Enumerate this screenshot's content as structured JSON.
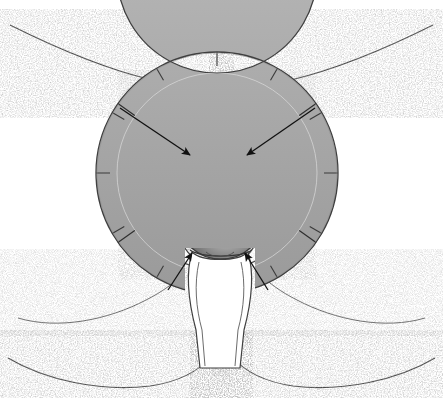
{
  "figure": {
    "domain_note": "grayscale medical line-art illustration",
    "background_color": "#ffffff",
    "width": 443,
    "height": 400
  },
  "palette": {
    "ink": "#3a3a3a",
    "ink_dark": "#1c1c1c",
    "ring_fill": "#a9a9a9",
    "ring_fill_light": "#bdbdbd",
    "ring_edge": "#4a4a4a",
    "mass_dark": "#5a5a5a",
    "mass_mid": "#7d7d7d",
    "mass_light": "#cfcfcf",
    "tissue_light": "#f2f2f2",
    "tissue_mid": "#d4d4d4",
    "os_fill": "#b4b4b4",
    "stipple": "#6e6e6e",
    "arrow": "#111111",
    "white": "#ffffff"
  },
  "retractor_ring": {
    "name": "self-retaining ring retractor",
    "center_x": 217,
    "center_y": 173,
    "outer_radius": 121,
    "inner_radius": 100,
    "band_width": 21,
    "notch_count": 12,
    "notch_angles_deg": [
      -90,
      -60,
      -30,
      0,
      30,
      60,
      90,
      120,
      150,
      180,
      210,
      240
    ],
    "segment_break_angles_deg": [
      -145,
      -35,
      35,
      145
    ],
    "occluded_bottom_arc_deg": [
      72,
      108
    ]
  },
  "inner_oval": {
    "name": "inner tissue margin oval",
    "center_x": 217,
    "center_y": 175,
    "rx": 96,
    "ry": 94
  },
  "arrows": [
    {
      "id": "arrow-upper-left",
      "tail_x": 120,
      "tail_y": 108,
      "tip_x": 190,
      "tip_y": 155,
      "label": "upper left pointer"
    },
    {
      "id": "arrow-upper-right",
      "tail_x": 315,
      "tail_y": 108,
      "tip_x": 247,
      "tip_y": 155,
      "label": "upper right pointer"
    },
    {
      "id": "arrow-lower-left",
      "tail_x": 168,
      "tail_y": 290,
      "tip_x": 192,
      "tip_y": 253,
      "label": "lower left pointer"
    },
    {
      "id": "arrow-lower-right",
      "tail_x": 268,
      "tail_y": 290,
      "tip_x": 245,
      "tip_y": 253,
      "label": "lower right pointer"
    }
  ],
  "anatomy": {
    "dark_mass": {
      "name": "prolapsed spherical mass",
      "center_x": 221,
      "center_y": 222,
      "rx": 41,
      "ry": 37,
      "highlight_x": 228,
      "highlight_y": 228
    },
    "os_ring": {
      "name": "circular os with crossing sutures",
      "center_x": 219,
      "center_y": 168,
      "rx": 26,
      "ry": 24,
      "suture_count": 4
    },
    "catheter": {
      "name": "catheter tube",
      "color": "#efefef",
      "outline": "#4a4a4a"
    },
    "suture_threads": {
      "name": "suture threads",
      "count": 5
    },
    "vaginal_vault": {
      "name": "hatched tissue vault",
      "hatch_color": "#555555"
    },
    "exit_tube": {
      "name": "lower exit tube / introitus",
      "color": "#ffffff"
    }
  },
  "body_contours": [
    {
      "id": "contour-upper-left",
      "label": "upper left thigh contour"
    },
    {
      "id": "contour-upper-right",
      "label": "upper right thigh contour"
    },
    {
      "id": "contour-lower-left",
      "label": "lower left buttock contour"
    },
    {
      "id": "contour-lower-right",
      "label": "lower right buttock contour"
    },
    {
      "id": "contour-lower-inner-left",
      "label": "inner lower left fold"
    },
    {
      "id": "contour-lower-inner-right",
      "label": "inner lower right fold"
    },
    {
      "id": "contour-perineal-raphe",
      "label": "perineal raphe stipple"
    }
  ]
}
